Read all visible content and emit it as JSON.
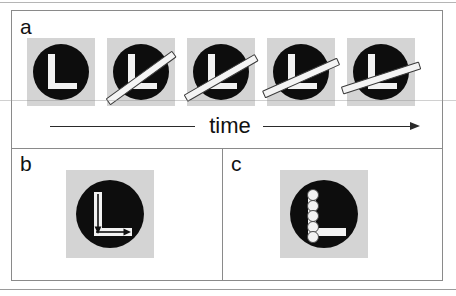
{
  "figure": {
    "background_color": "#ffffff",
    "frame_color": "#8a8a8a",
    "tile_color": "#d4d4d4",
    "disc_color": "#0d0d0d",
    "shape_color": "#f2f2f2",
    "bar_fill": "#f4f4f4",
    "bar_outline": "#3a3a3a"
  },
  "panels": {
    "a": {
      "label": "a",
      "axis_label": "time",
      "axis_direction": "left-to-right",
      "frame_count": 5,
      "frames": [
        {
          "index": 1,
          "has_bar": false,
          "bar_angle_deg": null,
          "description": "black disc with white L, no bar"
        },
        {
          "index": 2,
          "has_bar": true,
          "bar_angle_deg": 36,
          "description": "bar crossing disc from lower-left to upper-right"
        },
        {
          "index": 3,
          "has_bar": true,
          "bar_angle_deg": 30,
          "description": "bar rotated slightly toward horizontal arm"
        },
        {
          "index": 4,
          "has_bar": true,
          "bar_angle_deg": 24,
          "description": "bar closer to the L horizontal arm"
        },
        {
          "index": 5,
          "has_bar": true,
          "bar_angle_deg": 18,
          "description": "bar nearly aligned with the L horizontal arm"
        }
      ]
    },
    "b": {
      "label": "b",
      "description": "white L inside black disc with black arrows running down the vertical arm and right along the horizontal arm",
      "arrows": [
        {
          "name": "down-arrow",
          "direction": "down"
        },
        {
          "name": "right-arrow",
          "direction": "right"
        }
      ]
    },
    "c": {
      "label": "c",
      "description": "white L inside black disc with a chain of outlined circles stacked along the vertical arm",
      "bead_count": 5
    }
  }
}
